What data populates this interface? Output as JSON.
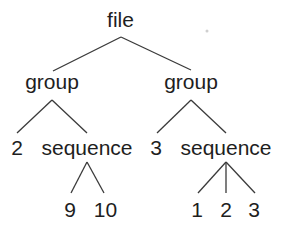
{
  "diagram": {
    "type": "tree",
    "root": {
      "label": "file",
      "children": [
        {
          "label": "group",
          "children": [
            {
              "label": "2"
            },
            {
              "label": "sequence",
              "children": [
                {
                  "label": "9"
                },
                {
                  "label": "10"
                }
              ]
            }
          ]
        },
        {
          "label": "group",
          "children": [
            {
              "label": "3"
            },
            {
              "label": "sequence",
              "children": [
                {
                  "label": "1"
                },
                {
                  "label": "2"
                },
                {
                  "label": "3"
                }
              ]
            }
          ]
        }
      ]
    },
    "nodes": {
      "file": "file",
      "group_left": "group",
      "group_right": "group",
      "num_2": "2",
      "sequence_left": "sequence",
      "num_3": "3",
      "sequence_right": "sequence",
      "leaf_9": "9",
      "leaf_10": "10",
      "leaf_1": "1",
      "leaf_2": "2",
      "leaf_3": "3"
    },
    "colors": {
      "text": "#1e1e1e",
      "edges": "#3a3a3a",
      "background": "#ffffff"
    }
  }
}
